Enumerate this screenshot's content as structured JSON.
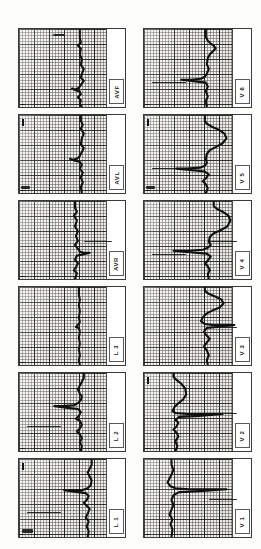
{
  "document": {
    "title": "12-Lead Electrocardiogram",
    "kind": "ecg-strip-sheet",
    "orientation": "rotated-90",
    "columns": 2,
    "rows": 6,
    "paper_color": "#f4f2ef",
    "grid_color": "#3c3c3c",
    "trace_color": "#101010",
    "background": "#ffffff"
  },
  "grid": {
    "small_square_px": 3,
    "large_square_px": 15,
    "small_square_mm": 1,
    "large_square_mm": 5,
    "paper_speed": "25 mm/s",
    "gain": "10 mm/mV"
  },
  "panels": [
    {
      "id": "avf",
      "label": "AVF",
      "column": "left",
      "row": 1,
      "x": 18,
      "y": 28,
      "w": 108,
      "h": 80,
      "margin_w": 18,
      "has_cal": false,
      "has_tick": true,
      "artifacts": [
        "top-left-bar"
      ],
      "trace": "M 62 0 L 62 9 L 63 14 L 60 17 L 63 20 L 62 26 L 64 31 L 63 37 L 66 41 L 64 46 L 63 50 L 66 53 L 64 56 L 62 59 L 60 61 L 57 62 L 54 61 L 58 63 L 62 64 L 63 67 L 60 70 L 63 73 L 62 77 L 64 80"
    },
    {
      "id": "avl",
      "label": "AVL",
      "column": "left",
      "row": 2,
      "x": 18,
      "y": 114,
      "w": 108,
      "h": 80,
      "margin_w": 18,
      "has_cal": true,
      "has_tick": true,
      "artifacts": [
        "bottom-left-bar"
      ],
      "trace": "M 63 0 L 63 6 L 65 10 L 63 14 L 66 19 L 64 24 L 63 30 L 66 34 L 64 38 L 62 42 L 59 45 L 55 46 L 52 45 L 57 47 L 62 48 L 64 51 L 62 55 L 65 59 L 63 64 L 65 69 L 63 74 L 64 80"
    },
    {
      "id": "avr",
      "label": "AVR",
      "column": "left",
      "row": 3,
      "x": 18,
      "y": 200,
      "w": 108,
      "h": 80,
      "margin_w": 18,
      "has_cal": false,
      "has_tick": true,
      "artifacts": [
        "flat-line-right"
      ],
      "trace": "M 57 0 L 57 7 L 59 11 L 56 15 L 59 20 L 57 26 L 60 31 L 58 36 L 60 41 L 57 45 L 60 49 L 62 52 L 66 53 L 72 53 L 64 55 L 59 56 L 57 60 L 60 64 L 58 68 L 56 71 L 59 74 L 57 80"
    },
    {
      "id": "l3",
      "label": "L 3",
      "column": "left",
      "row": 4,
      "x": 18,
      "y": 286,
      "w": 108,
      "h": 80,
      "margin_w": 18,
      "has_cal": false,
      "has_tick": true,
      "artifacts": [],
      "trace": "M 61 0 L 61 8 L 62 13 L 61 19 L 62 25 L 61 31 L 62 36 L 60 39 L 58 41 L 61 42 L 62 46 L 61 52 L 62 58 L 61 64 L 62 70 L 61 75 L 62 80"
    },
    {
      "id": "l2",
      "label": "L 2",
      "column": "left",
      "row": 5,
      "x": 18,
      "y": 372,
      "w": 108,
      "h": 80,
      "margin_w": 18,
      "has_cal": false,
      "has_tick": true,
      "artifacts": [
        "flat-line-left"
      ],
      "trace": "M 66 0 L 66 5 L 64 9 L 62 13 L 60 17 L 62 21 L 64 24 L 63 28 L 60 31 L 56 33 L 44 34 L 36 34 L 52 36 L 60 37 L 63 40 L 61 44 L 58 47 L 62 49 L 64 53 L 62 57 L 59 60 L 62 63 L 64 67 L 62 71 L 64 75 L 63 80"
    },
    {
      "id": "l1",
      "label": "L 1",
      "column": "left",
      "row": 6,
      "x": 18,
      "y": 458,
      "w": 108,
      "h": 80,
      "margin_w": 18,
      "has_cal": true,
      "has_tick": true,
      "artifacts": [
        "bottom-left-blob",
        "flat-line-left"
      ],
      "trace": "M 74 0 L 74 6 L 72 10 L 70 14 L 72 18 L 74 22 L 73 27 L 70 30 L 64 32 L 54 32 L 46 32 L 60 34 L 68 35 L 71 38 L 69 42 L 66 45 L 69 48 L 72 51 L 70 56 L 68 60 L 71 64 L 69 69 L 71 74 L 70 80"
    },
    {
      "id": "v6",
      "label": "V 6",
      "column": "right",
      "row": 1,
      "x": 143,
      "y": 28,
      "w": 109,
      "h": 80,
      "margin_w": 18,
      "has_cal": false,
      "has_tick": true,
      "artifacts": [
        "flat-line-left"
      ],
      "trace": "M 63 0 L 63 8 L 65 12 L 68 15 L 71 17 L 73 20 L 70 23 L 67 26 L 65 30 L 64 36 L 66 41 L 64 46 L 62 49 L 58 51 L 48 52 L 38 52 L 55 54 L 63 55 L 65 59 L 63 64 L 65 69 L 63 74 L 64 80"
    },
    {
      "id": "v5",
      "label": "V 5",
      "column": "right",
      "row": 2,
      "x": 143,
      "y": 114,
      "w": 109,
      "h": 80,
      "margin_w": 18,
      "has_cal": true,
      "has_tick": true,
      "artifacts": [
        "flat-line-left",
        "bottom-left-bar"
      ],
      "trace": "M 62 0 L 62 6 L 64 9 L 69 12 L 76 15 L 82 19 L 84 24 L 80 29 L 73 33 L 67 36 L 64 40 L 63 45 L 64 49 L 62 52 L 57 54 L 44 55 L 33 55 L 52 57 L 62 58 L 66 61 L 63 65 L 60 68 L 63 71 L 65 75 L 63 80"
    },
    {
      "id": "v4",
      "label": "V 4",
      "column": "right",
      "row": 3,
      "x": 143,
      "y": 200,
      "w": 109,
      "h": 80,
      "margin_w": 18,
      "has_cal": false,
      "has_tick": true,
      "artifacts": [
        "flat-line-left",
        "flat-line-right"
      ],
      "trace": "M 71 0 L 71 5 L 74 8 L 80 11 L 86 15 L 88 20 L 85 26 L 78 30 L 71 33 L 67 37 L 66 42 L 68 45 L 65 48 L 60 50 L 46 51 L 30 51 L 52 53 L 64 54 L 68 57 L 65 61 L 62 64 L 65 67 L 67 71 L 65 75 L 66 80"
    },
    {
      "id": "v3",
      "label": "V 3",
      "column": "right",
      "row": 4,
      "x": 143,
      "y": 286,
      "w": 109,
      "h": 80,
      "margin_w": 18,
      "has_cal": false,
      "has_tick": true,
      "artifacts": [
        "flat-line-right"
      ],
      "trace": "M 62 0 L 62 4 L 66 7 L 73 10 L 79 13 L 81 17 L 77 21 L 70 24 L 64 27 L 60 31 L 58 35 L 62 38 L 70 39 L 82 39 L 92 39 L 74 41 L 64 42 L 61 46 L 64 50 L 67 53 L 64 57 L 61 61 L 64 65 L 66 70 L 64 75 L 65 80"
    },
    {
      "id": "v2",
      "label": "V 2",
      "column": "right",
      "row": 5,
      "x": 143,
      "y": 372,
      "w": 109,
      "h": 80,
      "margin_w": 18,
      "has_cal": true,
      "has_tick": true,
      "artifacts": [
        "flat-line-right"
      ],
      "trace": "M 30 0 L 30 4 L 33 7 L 38 11 L 42 16 L 43 22 L 40 27 L 35 31 L 31 35 L 29 39 L 32 41 L 44 42 L 62 42 L 80 42 L 56 44 L 36 45 L 32 48 L 35 51 L 33 55 L 30 58 L 33 61 L 35 65 L 32 70 L 34 75 L 32 80"
    },
    {
      "id": "v1",
      "label": "V 1",
      "column": "right",
      "row": 6,
      "x": 143,
      "y": 458,
      "w": 109,
      "h": 80,
      "margin_w": 18,
      "has_cal": false,
      "has_tick": true,
      "artifacts": [
        "flat-line-right"
      ],
      "trace": "M 28 0 L 28 6 L 30 11 L 28 16 L 26 20 L 24 24 L 27 28 L 32 30 L 46 31 L 66 31 L 84 31 L 56 33 L 36 34 L 30 37 L 28 42 L 30 47 L 28 52 L 26 57 L 29 62 L 27 67 L 29 72 L 28 80"
    }
  ],
  "leads_order": [
    "AVF",
    "AVL",
    "AVR",
    "L 3",
    "L 2",
    "L 1",
    "V 6",
    "V 5",
    "V 4",
    "V 3",
    "V 2",
    "V 1"
  ]
}
